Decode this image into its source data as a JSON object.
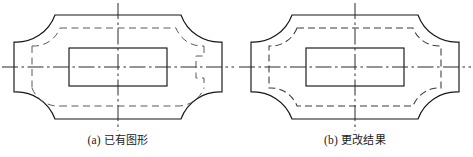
{
  "page": {
    "background_color": "#ffffff",
    "line_color": "#151515",
    "dashed_color": "#3a3a3a",
    "centerline_color": "#2a2a2a",
    "width": 473,
    "height": 157
  },
  "figures": [
    {
      "id": "figure-a",
      "caption_label": "(a)",
      "caption_text": "已有图形",
      "description": "outer solid outline with concave corner fillets, partial dashed offset contour, solid inner rectangle, horizontal and vertical centerlines"
    },
    {
      "id": "figure-b",
      "caption_label": "(b)",
      "caption_text": "更改结果",
      "description": "outer solid outline with concave corner fillets, complete closed dashed offset contour, solid inner rectangle, horizontal and vertical centerlines"
    }
  ],
  "drawing": {
    "outline_points": {
      "left_x": 14,
      "right_x": 222,
      "top_y": 15,
      "bottom_y": 119,
      "flat_top_left_x": 55,
      "flat_top_right_x": 181,
      "corner_radius": 41,
      "side_top_y": 42,
      "side_bottom_y": 92
    },
    "inner_rect": {
      "x": 69,
      "y": 48,
      "width": 98,
      "height": 38
    },
    "offset_inset": 13,
    "centerlines": {
      "horizontal_y": 67,
      "vertical_x": 118,
      "h_start_x": 2,
      "h_end_x": 234,
      "v_start_y": 3,
      "v_end_y": 131
    },
    "line_styles": {
      "outline_width": 1.15,
      "dashed_pattern": "7 4",
      "centerline_pattern": "16 3.5 2.5 3.5"
    }
  }
}
